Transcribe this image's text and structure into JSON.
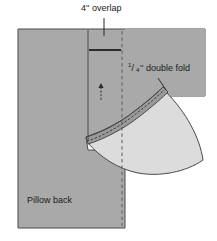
{
  "diagram": {
    "labels": {
      "overlap": "4'' overlap",
      "double_fold_fraction_numerator": "1",
      "double_fold_fraction_slash": "/",
      "double_fold_fraction_denominator": "4",
      "double_fold_rest": "'' double fold",
      "pillow_back": "Pillow back"
    },
    "colors": {
      "fabric_right_side": "#a9a9a9",
      "fabric_wrong_side": "#dcdcdc",
      "hem_band": "#9a9a9a",
      "outline": "#4a4a4a",
      "stitch_line": "#3d3d3d",
      "fold_line_dashed": "#5a5a5a",
      "leader_line": "#2b2b2b",
      "background": "#ffffff"
    },
    "geometry": {
      "panel_left": 18,
      "panel_top": 29,
      "panel_right": 125,
      "panel_bottom": 228,
      "fold_line_x": 122,
      "overlap_edge_x": 88,
      "overlap_marker_y": 50,
      "arrow_x": 101,
      "arrow_top_y": 84,
      "arrow_bottom_y": 100
    }
  }
}
